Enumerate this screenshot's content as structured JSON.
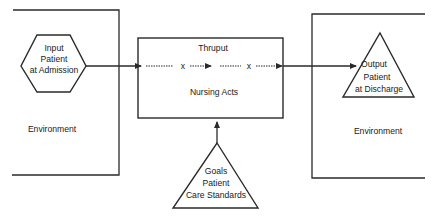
{
  "diagram": {
    "type": "systems-model",
    "colors": {
      "ink": "#2a2a2a",
      "background": "#ffffff"
    },
    "nodes": {
      "input": {
        "shape": "hexagon",
        "lines": [
          "Input",
          "Patient",
          "at Admission"
        ]
      },
      "thruput": {
        "shape": "rectangle",
        "title": "Thruput",
        "body": "Nursing Acts"
      },
      "output": {
        "shape": "triangle",
        "lines": [
          "Output",
          "Patient",
          "at Discharge"
        ]
      },
      "goals": {
        "shape": "triangle",
        "lines": [
          "Goals",
          "Patient",
          "Care Standards"
        ]
      }
    },
    "environments": {
      "left": {
        "label": "Environment"
      },
      "right": {
        "label": "Environment"
      }
    },
    "flow_markers": [
      "x",
      "x"
    ],
    "edges": [
      {
        "from": "input",
        "to": "thruput"
      },
      {
        "from": "thruput",
        "to": "output"
      },
      {
        "from": "goals",
        "to": "thruput"
      }
    ]
  }
}
